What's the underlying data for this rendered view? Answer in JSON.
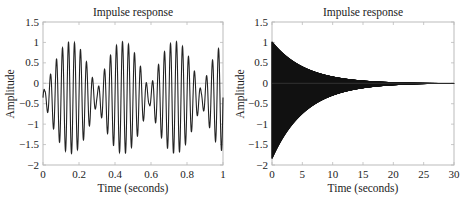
{
  "header_fragment": "g… … … … …",
  "chart_data": [
    {
      "type": "line",
      "title": "Impulse response",
      "xlabel": "Time (seconds)",
      "ylabel": "Amplitude",
      "xlim": [
        0,
        1
      ],
      "ylim": [
        -2,
        1.5
      ],
      "xticks": [
        "0",
        "0.2",
        "0.4",
        "0.6",
        "0.8",
        "1"
      ],
      "yticks": [
        "1.5",
        "1",
        "0.5",
        "0",
        "-0.5",
        "-1",
        "-1.5",
        "-2"
      ],
      "grid": false,
      "description": "Beating oscillation (~30 Hz carrier, ~3.5 Hz beat), amplitude envelope peaks ~1.0 / -1.7 near t=0.15, 0.44, 0.73; minima near t=0.32, 0.61, 0.9",
      "series": [
        {
          "name": "impulse",
          "carrier_hz": 30,
          "beat_hz": 3.45,
          "peak_max": 1.02,
          "peak_min": -1.72,
          "offset": -0.35,
          "color": "#111111"
        }
      ]
    },
    {
      "type": "line",
      "title": "Impulse response",
      "xlabel": "Time (seconds)",
      "ylabel": "Amplitude",
      "xlim": [
        0,
        30
      ],
      "ylim": [
        -2,
        1.5
      ],
      "xticks": [
        "0",
        "5",
        "10",
        "15",
        "20",
        "25",
        "30"
      ],
      "yticks": [
        "1.5",
        "1",
        "0.5",
        "0",
        "-0.5",
        "-1",
        "-1.5",
        "-2"
      ],
      "grid": false,
      "description": "Exponentially decaying high-frequency oscillation; starts at ~1.0 / -1.8 at t=0 and decays to ~0 by t≈20",
      "series": [
        {
          "name": "impulse",
          "initial_max": 1.02,
          "initial_min": -1.85,
          "decay_time_constant": 5.5,
          "color": "#111111"
        }
      ]
    }
  ]
}
